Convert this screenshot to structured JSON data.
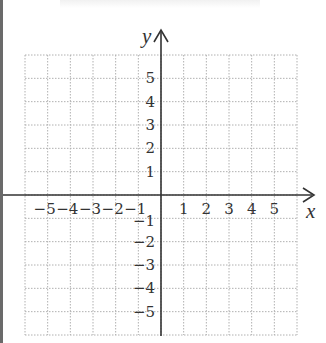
{
  "diagram": {
    "type": "coordinate-plane",
    "x_axis_label": "x",
    "y_axis_label": "y",
    "x_range": [
      -6,
      6
    ],
    "y_range": [
      -6,
      6
    ],
    "grid": "dotted",
    "x_tick_labels": [
      "-5",
      "-4",
      "-3",
      "-2",
      "-1",
      "1",
      "2",
      "3",
      "4",
      "5"
    ],
    "y_tick_labels": [
      "5",
      "4",
      "3",
      "2",
      "1",
      "-1",
      "-2",
      "-3",
      "-4",
      "-5"
    ],
    "colors": {
      "axis": "#333333",
      "grid": "#b0b0b0",
      "border": "#6a6a6a"
    }
  }
}
